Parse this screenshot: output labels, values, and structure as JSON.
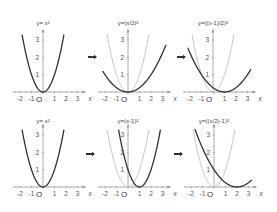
{
  "layout": {
    "unit_x": 11.5,
    "unit_y": 17.3,
    "x_range": [
      -2.2,
      3.3
    ],
    "y_top": 3.35,
    "colors": {
      "axis": "#9a9a9a",
      "base_curve": "#b5b5b5",
      "transformed_curve": "#333333",
      "arrow": "#333333"
    }
  },
  "axis_labels": {
    "x": "x",
    "y": "y",
    "origin": "O"
  },
  "x_ticks": [
    "-2",
    "-1",
    "1",
    "2",
    "3"
  ],
  "y_ticks": [
    "1",
    "2",
    "3"
  ],
  "rows": [
    {
      "axis_y": 92,
      "label_y": 25,
      "arrow_y": 57,
      "panels": [
        {
          "origin_x": 43,
          "label": "y= x²",
          "expr": "x*x",
          "show_base": false
        },
        {
          "origin_x": 128,
          "label": "y=(x/2)²",
          "expr": "(x/2)*(x/2)",
          "show_base": true
        },
        {
          "origin_x": 213,
          "label": "y=((x-1)/2)²",
          "expr": "((x-1)/2)*((x-1)/2)",
          "show_base": true
        }
      ],
      "arrows_x": [
        92,
        181
      ]
    },
    {
      "axis_y": 187,
      "label_y": 123,
      "arrow_y": 154,
      "panels": [
        {
          "origin_x": 43,
          "label": "y= x²",
          "expr": "x*x",
          "show_base": false
        },
        {
          "origin_x": 128,
          "label": "y=(x-1)²",
          "expr": "(x-1)*(x-1)",
          "show_base": true
        },
        {
          "origin_x": 214,
          "label": "y=((x/2)-1)²",
          "expr": "(x/2-1)*(x/2-1)",
          "show_base": true
        }
      ],
      "arrows_x": [
        90,
        178
      ]
    }
  ]
}
